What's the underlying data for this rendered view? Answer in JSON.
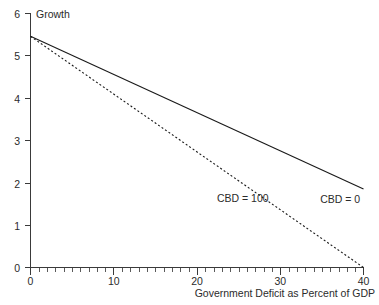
{
  "chart_data": {
    "type": "line",
    "title": "",
    "xlabel": "Government Deficit as Percent of GDP",
    "ylabel": "Growth",
    "xlim": [
      0,
      40
    ],
    "ylim": [
      0,
      6
    ],
    "grid": false,
    "legend_position": "inline-annotation",
    "x_ticks": [
      0,
      10,
      20,
      30,
      40
    ],
    "x_tick_labels": [
      "0",
      "10",
      "20",
      "30",
      "40"
    ],
    "x_minor_tick_step": 1,
    "y_ticks": [
      0,
      1,
      2,
      3,
      4,
      5,
      6
    ],
    "y_tick_labels": [
      "0",
      "1",
      "2",
      "3",
      "4",
      "5",
      "6"
    ],
    "series": [
      {
        "name": "CBD = 0",
        "style": "solid",
        "color": "#1a1a1a",
        "x": [
          0,
          40
        ],
        "values": [
          5.45,
          1.85
        ],
        "annotation": "CBD = 0"
      },
      {
        "name": "CBD = 100",
        "style": "dashed",
        "color": "#1a1a1a",
        "x": [
          0,
          40
        ],
        "values": [
          5.45,
          0.0
        ],
        "annotation": "CBD = 100"
      }
    ],
    "annotations": [
      {
        "text": "CBD = 100",
        "x": 25.5,
        "y": 1.62
      },
      {
        "text": "CBD = 0",
        "x": 37.2,
        "y": 1.6
      }
    ]
  },
  "axes": {
    "y_axis_label": "Growth",
    "x_axis_label": "Government Deficit as Percent of GDP",
    "y_labels": [
      "6",
      "5",
      "4",
      "3",
      "2",
      "1",
      "0"
    ],
    "x_labels": [
      "0",
      "10",
      "20",
      "30",
      "40"
    ]
  },
  "labels": {
    "cbd_100": "CBD = 100",
    "cbd_0": "CBD = 0"
  },
  "colors": {
    "line": "#1a1a1a",
    "axis": "#3a3a3a",
    "text": "#2b2b2b",
    "background": "#ffffff"
  }
}
